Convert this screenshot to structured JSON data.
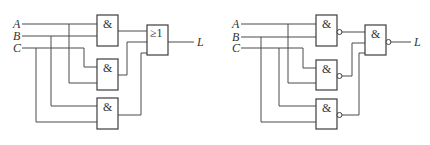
{
  "left_circuit": {
    "inputs": [
      {
        "label": "A"
      },
      {
        "label": "B"
      },
      {
        "label": "C"
      }
    ],
    "gates": [
      {
        "type": "AND",
        "symbol": "&",
        "inputs": [
          "A",
          "B"
        ]
      },
      {
        "type": "AND",
        "symbol": "&",
        "inputs": [
          "C",
          "A"
        ]
      },
      {
        "type": "AND",
        "symbol": "&",
        "inputs": [
          "B",
          "C"
        ]
      }
    ],
    "output_gate": {
      "type": "OR",
      "symbol": "≥1"
    },
    "output": {
      "label": "L"
    }
  },
  "right_circuit": {
    "inputs": [
      {
        "label": "A"
      },
      {
        "label": "B"
      },
      {
        "label": "C"
      }
    ],
    "gates": [
      {
        "type": "NAND",
        "symbol": "&",
        "inputs": [
          "A",
          "B"
        ]
      },
      {
        "type": "NAND",
        "symbol": "&",
        "inputs": [
          "C",
          "A"
        ]
      },
      {
        "type": "NAND",
        "symbol": "&",
        "inputs": [
          "C",
          "B"
        ]
      }
    ],
    "output_gate": {
      "type": "NAND",
      "symbol": "&"
    },
    "output": {
      "label": "L"
    }
  },
  "colors": {
    "line": "#4a4a4a",
    "background": "#ffffff"
  }
}
